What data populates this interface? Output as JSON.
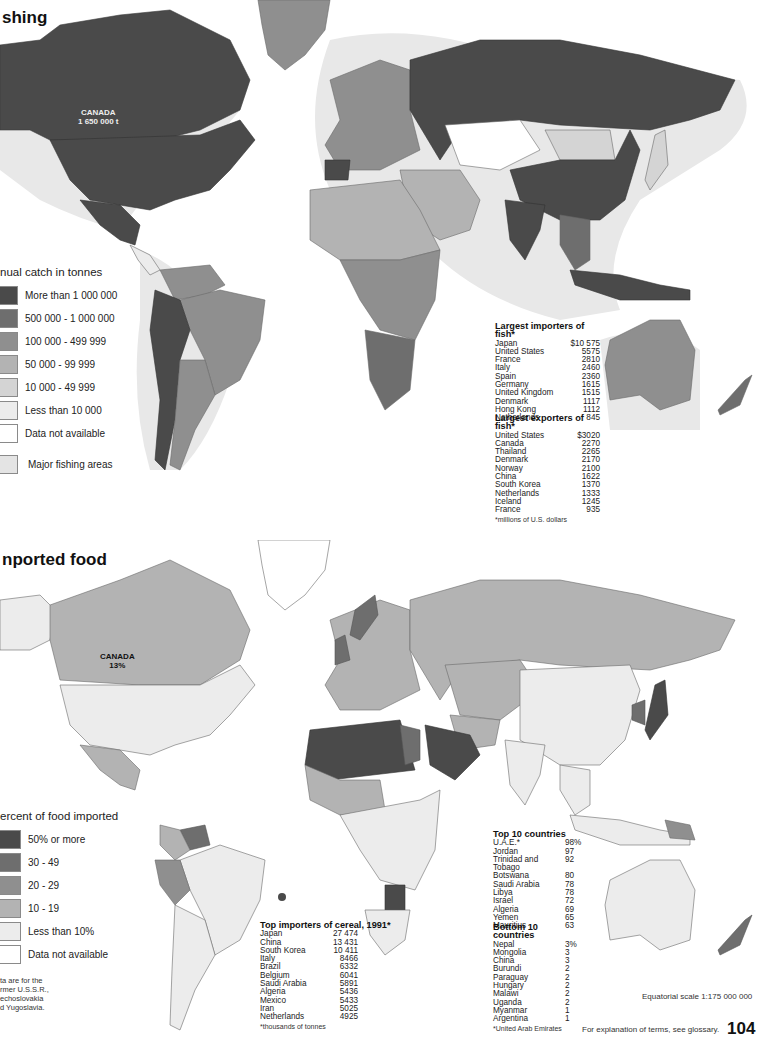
{
  "colors": {
    "c1": "#4a4a4a",
    "c2": "#6e6e6e",
    "c3": "#8f8f8f",
    "c4": "#b3b3b3",
    "c5": "#d4d4d4",
    "c6": "#ececec",
    "c7": "#ffffff",
    "fishing_area": "#e4e4e4",
    "border": "#6a6a6a"
  },
  "fishing": {
    "title": "shing",
    "canada_label": "CANADA",
    "canada_value": "1 650 000 t",
    "legend": {
      "title": "nual catch in tonnes",
      "items": [
        {
          "label": "More than 1 000 000",
          "color": "#4a4a4a"
        },
        {
          "label": "500 000 - 1 000 000",
          "color": "#6e6e6e"
        },
        {
          "label": "100 000 - 499 999",
          "color": "#8f8f8f"
        },
        {
          "label": "50 000 - 99 999",
          "color": "#b3b3b3"
        },
        {
          "label": "10 000 - 49 999",
          "color": "#d4d4d4"
        },
        {
          "label": "Less than 10 000",
          "color": "#ececec"
        },
        {
          "label": "Data not available",
          "color": "#ffffff"
        }
      ],
      "extra": {
        "label": "Major fishing areas",
        "color": "#e4e4e4"
      }
    },
    "importers": {
      "title": "Largest importers of fish*",
      "rows": [
        {
          "name": "Japan",
          "value": "$10 575"
        },
        {
          "name": "United States",
          "value": "5575"
        },
        {
          "name": "France",
          "value": "2810"
        },
        {
          "name": "Italy",
          "value": "2460"
        },
        {
          "name": "Spain",
          "value": "2360"
        },
        {
          "name": "Germany",
          "value": "1615"
        },
        {
          "name": "United Kingdom",
          "value": "1515"
        },
        {
          "name": "Denmark",
          "value": "1117"
        },
        {
          "name": "Hong Kong",
          "value": "1112"
        },
        {
          "name": "Netherlands",
          "value": "845"
        }
      ]
    },
    "exporters": {
      "title": "Largest exporters of fish*",
      "rows": [
        {
          "name": "United States",
          "value": "$3020"
        },
        {
          "name": "Canada",
          "value": "2270"
        },
        {
          "name": "Thailand",
          "value": "2265"
        },
        {
          "name": "Denmark",
          "value": "2170"
        },
        {
          "name": "Norway",
          "value": "2100"
        },
        {
          "name": "China",
          "value": "1622"
        },
        {
          "name": "South Korea",
          "value": "1370"
        },
        {
          "name": "Netherlands",
          "value": "1333"
        },
        {
          "name": "Iceland",
          "value": "1245"
        },
        {
          "name": "France",
          "value": "935"
        }
      ],
      "footnote": "*millions of U.S. dollars"
    }
  },
  "food": {
    "title": "nported food",
    "canada_label": "CANADA",
    "canada_value": "13%",
    "legend": {
      "title": "ercent of food imported",
      "items": [
        {
          "label": "50% or more",
          "color": "#4a4a4a"
        },
        {
          "label": "30 - 49",
          "color": "#6e6e6e"
        },
        {
          "label": "20 - 29",
          "color": "#8f8f8f"
        },
        {
          "label": "10 - 19",
          "color": "#b3b3b3"
        },
        {
          "label": "Less than 10%",
          "color": "#ececec"
        },
        {
          "label": "Data not available",
          "color": "#ffffff"
        }
      ]
    },
    "note": [
      "ta  are for the",
      "rmer U.S.S.R.,",
      "echoslovakia",
      "d Yugoslavia."
    ],
    "cereal": {
      "title": "Top importers of cereal, 1991*",
      "rows": [
        {
          "name": "Japan",
          "value": "27 474"
        },
        {
          "name": "China",
          "value": "13 431"
        },
        {
          "name": "South Korea",
          "value": "10 411"
        },
        {
          "name": "Italy",
          "value": "8466"
        },
        {
          "name": "Brazil",
          "value": "6332"
        },
        {
          "name": "Belgium",
          "value": "6041"
        },
        {
          "name": "Saudi Arabia",
          "value": "5891"
        },
        {
          "name": "Algeria",
          "value": "5436"
        },
        {
          "name": "Mexico",
          "value": "5433"
        },
        {
          "name": "Iran",
          "value": "5025"
        },
        {
          "name": "Netherlands",
          "value": "4925"
        }
      ],
      "footnote": "*thousands of tonnes"
    },
    "top10": {
      "title": "Top 10 countries",
      "rows": [
        {
          "name": "U.A.E.*",
          "value": "98%"
        },
        {
          "name": "Jordan",
          "value": "97"
        },
        {
          "name": "Trinidad and Tobago",
          "value": "92"
        },
        {
          "name": "Botswana",
          "value": "80"
        },
        {
          "name": "Saudi Arabia",
          "value": "78"
        },
        {
          "name": "Libya",
          "value": "78"
        },
        {
          "name": "Israel",
          "value": "72"
        },
        {
          "name": "Algeria",
          "value": "69"
        },
        {
          "name": "Yemen",
          "value": "65"
        },
        {
          "name": "Mauritius",
          "value": "63"
        }
      ]
    },
    "bottom10": {
      "title": "Bottom 10 countries",
      "rows": [
        {
          "name": "Nepal",
          "value": "3%"
        },
        {
          "name": "Mongolia",
          "value": "3"
        },
        {
          "name": "China",
          "value": "3"
        },
        {
          "name": "Burundi",
          "value": "2"
        },
        {
          "name": "Paraguay",
          "value": "2"
        },
        {
          "name": "Hungary",
          "value": "2"
        },
        {
          "name": "Malawi",
          "value": "2"
        },
        {
          "name": "Uganda",
          "value": "2"
        },
        {
          "name": "Myanmar",
          "value": "1"
        },
        {
          "name": "Argentina",
          "value": "1"
        }
      ],
      "footnote": "*United Arab Emirates"
    }
  },
  "scale": "Equatorial scale 1:175 000 000",
  "glossary": "For explanation of terms, see glossary.",
  "page_number": "104"
}
